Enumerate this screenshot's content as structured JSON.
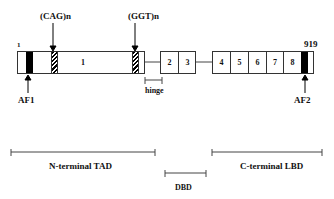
{
  "labels": {
    "start": "1",
    "end": "919",
    "cag": "(CAG)n",
    "ggt": "(GGT)n",
    "af1": "AF1",
    "af2": "AF2",
    "hinge": "hinge",
    "ntad": "N-terminal TAD",
    "dbd": "DBD",
    "clbd": "C-terminal LBD"
  },
  "exons": [
    "1",
    "2",
    "3",
    "4",
    "5",
    "6",
    "7",
    "8"
  ]
}
